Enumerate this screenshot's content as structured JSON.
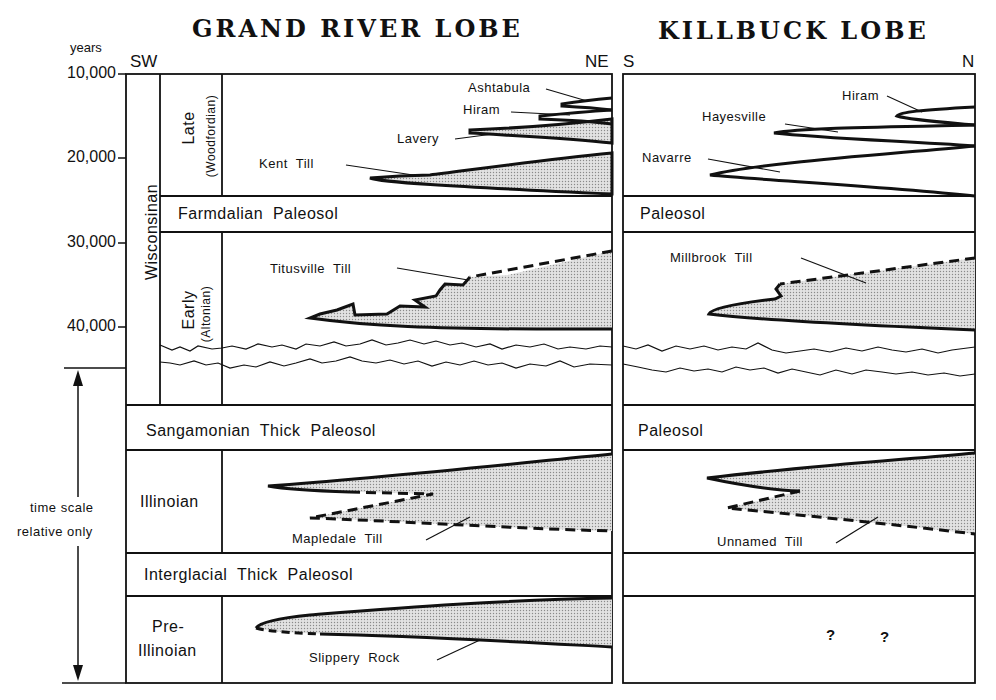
{
  "titles": {
    "grand_river": "GRAND RIVER LOBE",
    "killbuck": "KILLBUCK LOBE"
  },
  "directions": {
    "grand_river_left": "SW",
    "grand_river_right": "NE",
    "killbuck_left": "S",
    "killbuck_right": "N"
  },
  "axis": {
    "unit_label": "years",
    "ticks": [
      "10,000",
      "20,000",
      "30,000",
      "40,000"
    ],
    "time_scale_note_line1": "time scale",
    "time_scale_note_line2": "relative only"
  },
  "stages": {
    "wisconsinan": "Wisconsinan",
    "late": "Late",
    "late_sub": "(Woodfordian)",
    "early": "Early",
    "early_sub": "(Altonian)",
    "illinoian": "Illinoian",
    "pre_illinoian_line1": "Pre-",
    "pre_illinoian_line2": "Illinoian"
  },
  "paleosols": {
    "farmdalian": "Farmdalian  Paleosol",
    "sangamonian": "Sangamonian  Thick  Paleosol",
    "interglacial": "Interglacial  Thick  Paleosol",
    "killbuck_upper": "Paleosol",
    "killbuck_lower": "Paleosol"
  },
  "grand_river_units": {
    "ashtabula": "Ashtabula",
    "hiram": "Hiram",
    "lavery": "Lavery",
    "kent": "Kent  Till",
    "titusville": "Titusville  Till",
    "mapledale": "Mapledale  Till",
    "slippery_rock": "Slippery  Rock"
  },
  "killbuck_units": {
    "hiram": "Hiram",
    "hayesville": "Hayesville",
    "navarre": "Navarre",
    "millbrook": "Millbrook  Till",
    "unnamed": "Unnamed  Till",
    "unknown_1": "?",
    "unknown_2": "?"
  },
  "colors": {
    "line": "#111111",
    "till_fill": "#d4d4d4",
    "background": "#ffffff"
  }
}
